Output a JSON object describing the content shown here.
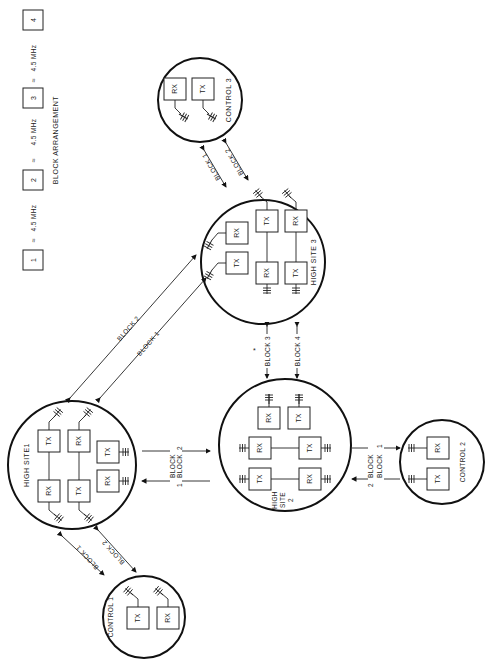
{
  "legend": {
    "title": "BLOCK ARRANGEMENT",
    "blocks": [
      "1",
      "2",
      "3",
      "4"
    ],
    "spacing_symbol": "≈",
    "spacings": [
      "4.5 MHz",
      "4.5 MHz",
      "4.5 MHz"
    ]
  },
  "sites": {
    "control1": {
      "name": "CONTROL 1",
      "units": [
        "TX",
        "RX"
      ]
    },
    "control2": {
      "name": "CONTROL 2",
      "units": [
        "RX",
        "TX"
      ]
    },
    "control3": {
      "name": "CONTROL 3",
      "units": [
        "RX",
        "TX"
      ]
    },
    "high1": {
      "name": "HIGH SITE1",
      "units": [
        "TX",
        "RX",
        "RX",
        "TX",
        "TX",
        "RX"
      ]
    },
    "high2": {
      "name_line1": "HIGH",
      "name_line2": "SITE",
      "name_line3": "2",
      "units": [
        "TX",
        "RX",
        "RX",
        "TX",
        "TX",
        "RX",
        "RX",
        "TX"
      ]
    },
    "high3": {
      "name": "HIGH  SITE  3",
      "units": [
        "RX",
        "TX",
        "TX",
        "RX",
        "RX",
        "TX"
      ]
    }
  },
  "links": {
    "c1_h1_a": "BLOCK 1",
    "c1_h1_b": "BLOCK 2",
    "h1_h3_a": "BLOCK   2",
    "h1_h3_b": "BLOCK 1",
    "h1_h2_a": "BLOCK",
    "h1_h2_a_num": "2",
    "h1_h2_b": "BLOCK",
    "h1_h2_b_num": "1",
    "h3_h2_a": "BLOCK 3",
    "h3_h2_b": "BLOCK 4",
    "h3_h2_note": "*",
    "h2_c2_a": "BLOCK",
    "h2_c2_a_num": "1",
    "h2_c2_b": "BLOCK",
    "h2_c2_b_num": "2",
    "h3_c3_a": "BLOCK 1",
    "h3_c3_b": "BLOCK 2"
  }
}
